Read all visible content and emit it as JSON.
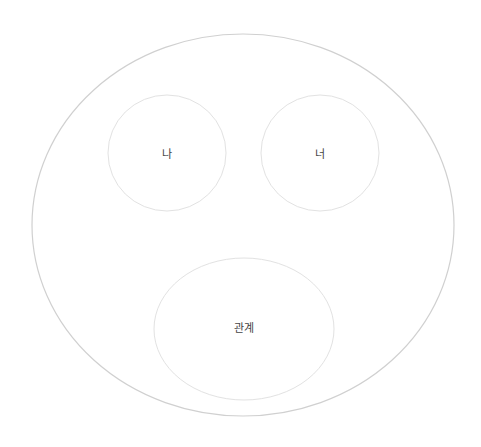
{
  "diagram": {
    "type": "nested-circles",
    "stroke_color": "#d6d6d6",
    "outer": {
      "cx": 243,
      "cy": 225,
      "rx": 211,
      "ry": 191
    },
    "nodes": [
      {
        "id": "me",
        "label": "나",
        "cx": 167,
        "cy": 153,
        "rx": 59,
        "ry": 58
      },
      {
        "id": "you",
        "label": "너",
        "cx": 320,
        "cy": 153,
        "rx": 59,
        "ry": 58
      },
      {
        "id": "relationship",
        "label": "관계",
        "cx": 244,
        "cy": 329,
        "rx": 90,
        "ry": 71
      }
    ]
  }
}
